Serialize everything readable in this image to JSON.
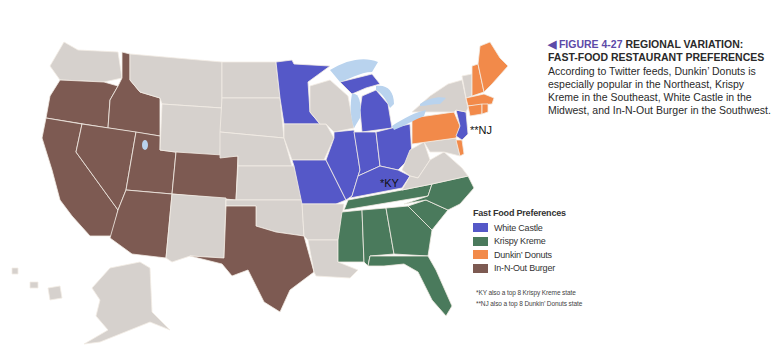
{
  "figure": {
    "marker": "◀",
    "number": "FIGURE 4-27",
    "title": "REGIONAL VARIATION: FAST-FOOD RESTAURANT PREFERENCES",
    "body": "According to Twitter feeds, Dunkin’ Donuts is especially popular in the Northeast, Krispy Kreme in the Southeast, White Castle in the Midwest, and In-N-Out Burger in the Southwest."
  },
  "legend": {
    "title": "Fast Food Preferences",
    "items": [
      {
        "label": "White Castle",
        "color": "#5558c8"
      },
      {
        "label": "Krispy Kreme",
        "color": "#4a7a5c"
      },
      {
        "label": "Dunkin’ Donuts",
        "color": "#f28a4a"
      },
      {
        "label": "In-N-Out Burger",
        "color": "#7d5a52"
      }
    ]
  },
  "colors": {
    "none": "#d6d1cd",
    "lake": "#b9d3ee",
    "white_castle": "#5558c8",
    "krispy_kreme": "#4a7a5c",
    "dunkin_donuts": "#f28a4a",
    "in_n_out": "#7d5a52"
  },
  "map_labels": {
    "ky": "*KY",
    "nj": "**NJ"
  },
  "footnotes": [
    "*KY also a top 8 Krispy Kreme state",
    "**NJ also a top 8 Dunkin’ Donuts state"
  ],
  "states": {
    "white_castle": [
      "MN",
      "MI",
      "IL",
      "IN",
      "OH",
      "MO",
      "KY",
      "NJ"
    ],
    "krispy_kreme": [
      "TN",
      "NC",
      "SC",
      "GA",
      "AL",
      "MS",
      "FL"
    ],
    "dunkin_donuts": [
      "ME",
      "NH",
      "MA",
      "RI",
      "CT",
      "PA",
      "DE"
    ],
    "in_n_out": [
      "OR",
      "ID",
      "CA",
      "NV",
      "UT",
      "AZ",
      "CO",
      "TX"
    ]
  }
}
